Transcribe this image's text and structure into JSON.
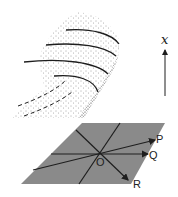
{
  "figure": {
    "axis_label": "x",
    "plane_labels": {
      "origin": "O",
      "p": "P",
      "q": "Q",
      "r": "R"
    },
    "colors": {
      "plane_fill": "#8a8a8a",
      "line": "#1e1e1e",
      "stipple": "#333333"
    },
    "surface": {
      "solid_curves": 4,
      "dashed_curves": 2
    }
  }
}
